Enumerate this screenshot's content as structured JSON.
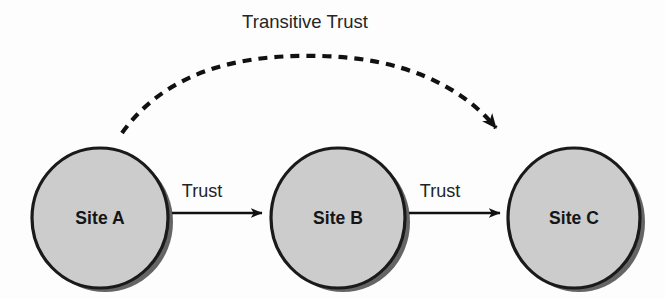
{
  "diagram": {
    "title": "Transitive Trust",
    "background_color": "#fdfdfd",
    "node_fill_color": "#cccccc",
    "node_stroke_color": "#1a1a1a",
    "shadow_color": "#4a4a4a",
    "line_color": "#111111",
    "nodes": [
      {
        "id": "site-a",
        "label": "Site A",
        "cx": 100,
        "cy": 218,
        "rx": 68,
        "ry": 70
      },
      {
        "id": "site-b",
        "label": "Site B",
        "cx": 338,
        "cy": 218,
        "rx": 67,
        "ry": 70
      },
      {
        "id": "site-c",
        "label": "Site C",
        "cx": 574,
        "cy": 218,
        "rx": 66,
        "ry": 70
      }
    ],
    "edges": [
      {
        "id": "trust-a-b",
        "label": "Trust",
        "style": "solid",
        "from": "site-a",
        "to": "site-b",
        "label_x": 202,
        "label_y": 197,
        "x1": 172,
        "y1": 213,
        "x2": 262,
        "y2": 213
      },
      {
        "id": "trust-b-c",
        "label": "Trust",
        "style": "solid",
        "from": "site-b",
        "to": "site-c",
        "label_x": 440,
        "label_y": 197,
        "x1": 409,
        "y1": 213,
        "x2": 500,
        "y2": 213
      },
      {
        "id": "transitive-trust-a-c",
        "label": "Transitive Trust",
        "style": "dashed",
        "from": "site-a",
        "to": "site-c",
        "dash_pattern": "9 7",
        "stroke_width": 4.2
      }
    ]
  }
}
